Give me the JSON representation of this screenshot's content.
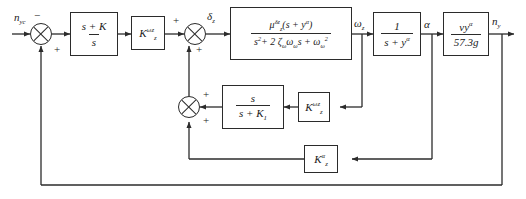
{
  "diagram": {
    "type": "control-system-block-diagram",
    "stroke_color": "#2b2b2b",
    "background": "#ffffff"
  },
  "signals": {
    "input": "n",
    "input_sub": "yc",
    "delta": "δ",
    "delta_sub": "z",
    "omega": "ω",
    "omega_sub": "z",
    "alpha": "α",
    "output": "n",
    "output_sub": "y"
  },
  "blocks": {
    "pi_controller": {
      "numerator": "s + K",
      "denominator": "s"
    },
    "rate_gain": {
      "symbol": "K",
      "sub": "z",
      "sup": "ωz"
    },
    "airframe": {
      "numerator": "μ",
      "num_sub": "z",
      "num_sup": "δz",
      "num_tail": "(s + y",
      "num_tail_sup": "α",
      "num_close": ")",
      "denominator": "s",
      "den_sup": "2",
      "den_mid": "+ 2 ζ",
      "den_zeta_sub": "ω",
      "den_omega": "ω",
      "den_omega_sub": "ω",
      "den_s": "s +  ω",
      "den_last_sub": "ω",
      "den_last_sup": "2"
    },
    "alpha_lag": {
      "numerator": "1",
      "denominator": "s + y",
      "den_sup": "α"
    },
    "accel_conv": {
      "numerator": "vy",
      "num_sup": "α",
      "denominator": "57.3g"
    },
    "washout": {
      "numerator": "s",
      "denominator": "s + K",
      "den_sub": "1"
    },
    "inner_gain": {
      "symbol": "K",
      "sub": "z",
      "sup": "ωz"
    },
    "outer_gain": {
      "symbol": "K",
      "sub": "z",
      "sup": "α"
    }
  },
  "summers": {
    "input_summer": {
      "top_sign": "−",
      "bottom_sign": "+"
    },
    "delta_summer": {
      "left_sign": "+",
      "bottom_sign": "+"
    },
    "inner_summer": {
      "right_sign": "+",
      "bottom_sign": "+"
    }
  }
}
